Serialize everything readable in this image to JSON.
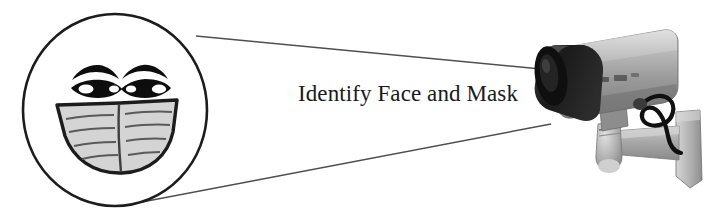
{
  "canvas": {
    "width": 726,
    "height": 220,
    "background": "#ffffff"
  },
  "caption": {
    "text": "Identify Face and Mask",
    "color": "#1a1a1a"
  },
  "magnifier": {
    "label": "face-with-mask-circle",
    "shape": "circle",
    "center_x": 115,
    "center_y": 110,
    "radius_x": 92,
    "radius_y": 96,
    "stroke": "#1c1c1c",
    "fill": "#ffffff"
  },
  "face": {
    "eyebrows": {
      "color": "#0d0d0d",
      "count": 2
    },
    "eyes": {
      "color": "#0d0d0d",
      "highlight": "#ffffff",
      "count": 2
    },
    "mask": {
      "label": "surgical-mask",
      "fill": "#d4d4d4",
      "stroke": "#1c1c1c",
      "pleat_color": "#4a4a4a",
      "pleat_lines_per_side": 4
    }
  },
  "sight_lines": {
    "label": "field-of-view-lines",
    "color": "#4a4a4a",
    "count": 2,
    "top": {
      "x1": 196,
      "y1": 36,
      "x2": 551,
      "y2": 70
    },
    "bottom": {
      "x1": 142,
      "y1": 202,
      "x2": 551,
      "y2": 124
    }
  },
  "camera": {
    "label": "cctv-security-camera",
    "body_light": "#c6c6c6",
    "body_mid": "#9b9b9b",
    "body_dark": "#767676",
    "hood_dark": "#1b1b1b",
    "lens_dark": "#121212",
    "mount_light": "#c2c2c2",
    "mount_mid": "#9e9e9e",
    "cable": "#101010",
    "parts": [
      "housing",
      "sun-shield-hood",
      "lens",
      "knuckle-joint",
      "mount-arm",
      "wall-plate",
      "power-cable"
    ]
  }
}
